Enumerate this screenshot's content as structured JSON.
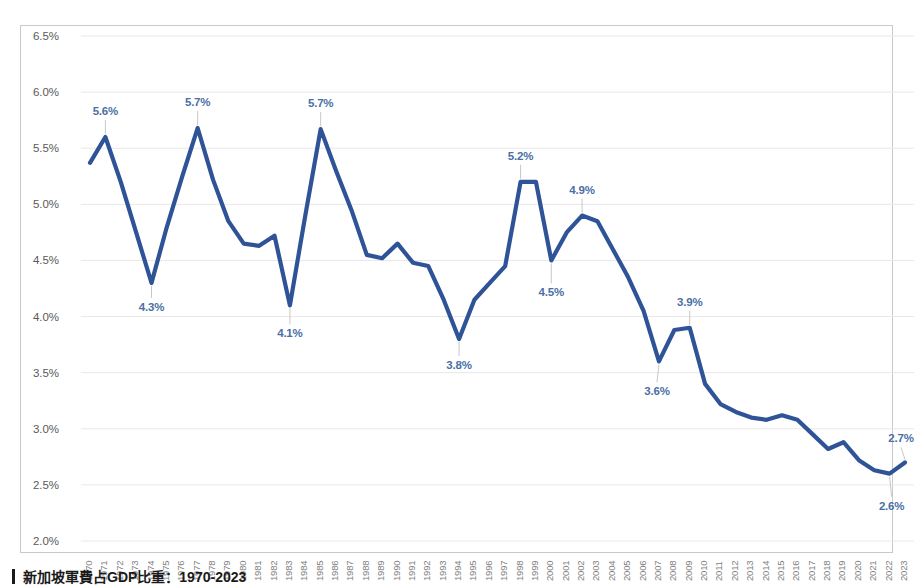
{
  "caption": {
    "text": "新加坡軍費占GDP比重：1970-2023",
    "bullet": "vertical-bar-marker"
  },
  "axis": {
    "y_ticks": [
      "2.0%",
      "2.5%",
      "3.0%",
      "3.5%",
      "4.0%",
      "4.5%",
      "5.0%",
      "5.5%",
      "6.0%",
      "6.5%"
    ],
    "x_ticks": [
      "1970",
      "1971",
      "1972",
      "1973",
      "1974",
      "1975",
      "1976",
      "1977",
      "1978",
      "1979",
      "1980",
      "1981",
      "1982",
      "1983",
      "1984",
      "1985",
      "1986",
      "1987",
      "1988",
      "1989",
      "1990",
      "1991",
      "1992",
      "1993",
      "1994",
      "1995",
      "1996",
      "1997",
      "1998",
      "1999",
      "2000",
      "2001",
      "2002",
      "2003",
      "2004",
      "2005",
      "2006",
      "2007",
      "2008",
      "2009",
      "2010",
      "2011",
      "2012",
      "2013",
      "2014",
      "2015",
      "2016",
      "2017",
      "2018",
      "2019",
      "2020",
      "2021",
      "2022",
      "2023"
    ]
  },
  "colors": {
    "line": "#2E5396",
    "label": "#4a6fa5",
    "grid": "#e8e8e8",
    "frame": "#c9c9c9",
    "tick_text": "#7f7f7f"
  },
  "chart_data": {
    "type": "line",
    "title": "",
    "xlabel": "",
    "ylabel": "",
    "ylim": [
      2.0,
      6.5
    ],
    "ytick_step": 0.5,
    "grid": true,
    "legend": "none",
    "x": [
      1970,
      1971,
      1972,
      1973,
      1974,
      1975,
      1976,
      1977,
      1978,
      1979,
      1980,
      1981,
      1982,
      1983,
      1984,
      1985,
      1986,
      1987,
      1988,
      1989,
      1990,
      1991,
      1992,
      1993,
      1994,
      1995,
      1996,
      1997,
      1998,
      1999,
      2000,
      2001,
      2002,
      2003,
      2004,
      2005,
      2006,
      2007,
      2008,
      2009,
      2010,
      2011,
      2012,
      2013,
      2014,
      2015,
      2016,
      2017,
      2018,
      2019,
      2020,
      2021,
      2022,
      2023
    ],
    "categories": [
      "1970",
      "1971",
      "1972",
      "1973",
      "1974",
      "1975",
      "1976",
      "1977",
      "1978",
      "1979",
      "1980",
      "1981",
      "1982",
      "1983",
      "1984",
      "1985",
      "1986",
      "1987",
      "1988",
      "1989",
      "1990",
      "1991",
      "1992",
      "1993",
      "1994",
      "1995",
      "1996",
      "1997",
      "1998",
      "1999",
      "2000",
      "2001",
      "2002",
      "2003",
      "2004",
      "2005",
      "2006",
      "2007",
      "2008",
      "2009",
      "2010",
      "2011",
      "2012",
      "2013",
      "2014",
      "2015",
      "2016",
      "2017",
      "2018",
      "2019",
      "2020",
      "2021",
      "2022",
      "2023"
    ],
    "values": [
      5.37,
      5.6,
      5.2,
      4.75,
      4.3,
      4.8,
      5.25,
      5.68,
      5.22,
      4.85,
      4.65,
      4.63,
      4.72,
      4.1,
      4.9,
      5.67,
      5.3,
      4.95,
      4.55,
      4.52,
      4.65,
      4.48,
      4.45,
      4.15,
      3.8,
      4.15,
      4.3,
      4.45,
      5.2,
      5.2,
      4.5,
      4.75,
      4.9,
      4.85,
      4.6,
      4.35,
      4.05,
      3.6,
      3.88,
      3.9,
      3.4,
      3.22,
      3.15,
      3.1,
      3.08,
      3.12,
      3.08,
      2.95,
      2.82,
      2.88,
      2.72,
      2.63,
      2.6,
      2.7
    ],
    "series": [
      {
        "name": "新加坡軍費占GDP比重",
        "values": [
          5.37,
          5.6,
          5.2,
          4.75,
          4.3,
          4.8,
          5.25,
          5.68,
          5.22,
          4.85,
          4.65,
          4.63,
          4.72,
          4.1,
          4.9,
          5.67,
          5.3,
          4.95,
          4.55,
          4.52,
          4.65,
          4.48,
          4.45,
          4.15,
          3.8,
          4.15,
          4.3,
          4.45,
          5.2,
          5.2,
          4.5,
          4.75,
          4.9,
          4.85,
          4.6,
          4.35,
          4.05,
          3.6,
          3.88,
          3.9,
          3.4,
          3.22,
          3.15,
          3.1,
          3.08,
          3.12,
          3.08,
          2.95,
          2.82,
          2.88,
          2.72,
          2.63,
          2.6,
          2.7
        ]
      }
    ],
    "point_labels": [
      {
        "year": 1971,
        "value": 5.6,
        "text": "5.6%",
        "dx": 0,
        "dy": -26
      },
      {
        "year": 1974,
        "value": 4.3,
        "text": "4.3%",
        "dx": 0,
        "dy": 24
      },
      {
        "year": 1977,
        "value": 5.68,
        "text": "5.7%",
        "dx": 0,
        "dy": -26
      },
      {
        "year": 1983,
        "value": 4.1,
        "text": "4.1%",
        "dx": 0,
        "dy": 28
      },
      {
        "year": 1985,
        "value": 5.67,
        "text": "5.7%",
        "dx": 0,
        "dy": -26
      },
      {
        "year": 1994,
        "value": 3.8,
        "text": "3.8%",
        "dx": 0,
        "dy": 26
      },
      {
        "year": 1998,
        "value": 5.2,
        "text": "5.2%",
        "dx": 0,
        "dy": -26
      },
      {
        "year": 2000,
        "value": 4.5,
        "text": "4.5%",
        "dx": 0,
        "dy": 32
      },
      {
        "year": 2002,
        "value": 4.9,
        "text": "4.9%",
        "dx": 0,
        "dy": -26
      },
      {
        "year": 2007,
        "value": 3.6,
        "text": "3.6%",
        "dx": -2,
        "dy": 30
      },
      {
        "year": 2009,
        "value": 3.9,
        "text": "3.9%",
        "dx": 0,
        "dy": -26
      },
      {
        "year": 2022,
        "value": 2.6,
        "text": "2.6%",
        "dx": 2,
        "dy": 32
      },
      {
        "year": 2023,
        "value": 2.7,
        "text": "2.7%",
        "dx": -4,
        "dy": -24
      }
    ]
  }
}
